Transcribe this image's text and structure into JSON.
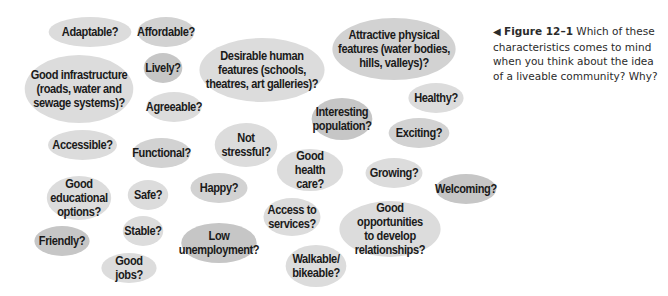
{
  "caption": {
    "arrow": "◀",
    "figure_label": "Figure 12–1",
    "text": "Which of these characteristics comes to mind when you think about the idea of a liveable community? Why?"
  },
  "bubbles": [
    {
      "id": "adaptable",
      "label": "Adaptable?",
      "x": 45,
      "y": 17,
      "w": 90,
      "h": 30,
      "shade": "light"
    },
    {
      "id": "affordable",
      "label": "Affordable?",
      "x": 135,
      "y": 17,
      "w": 62,
      "h": 30,
      "shade": "mid"
    },
    {
      "id": "good-infrastructure",
      "label": "Good infrastructure\n(roads, water and\nsewage systems)?",
      "x": 20,
      "y": 55,
      "w": 118,
      "h": 68,
      "shade": "light"
    },
    {
      "id": "lively",
      "label": "Lively?",
      "x": 142,
      "y": 53,
      "w": 42,
      "h": 30,
      "shade": "dark"
    },
    {
      "id": "agreeable",
      "label": "Agreeable?",
      "x": 144,
      "y": 92,
      "w": 60,
      "h": 30,
      "shade": "light"
    },
    {
      "id": "desirable-human-features",
      "label": "Desirable human\nfeatures (schools,\ntheatres, art galleries)?",
      "x": 194,
      "y": 38,
      "w": 136,
      "h": 64,
      "shade": "light"
    },
    {
      "id": "attractive-physical-features",
      "label": "Attractive physical\nfeatures (water bodies,\nhills, valleys)?",
      "x": 327,
      "y": 18,
      "w": 134,
      "h": 62,
      "shade": "mid"
    },
    {
      "id": "healthy",
      "label": "Healthy?",
      "x": 406,
      "y": 83,
      "w": 60,
      "h": 30,
      "shade": "light"
    },
    {
      "id": "interesting-population",
      "label": "Interesting\npopulation?",
      "x": 309,
      "y": 98,
      "w": 66,
      "h": 42,
      "shade": "dark"
    },
    {
      "id": "exciting",
      "label": "Exciting?",
      "x": 386,
      "y": 118,
      "w": 66,
      "h": 30,
      "shade": "mid"
    },
    {
      "id": "accessible",
      "label": "Accessible?",
      "x": 45,
      "y": 130,
      "w": 75,
      "h": 30,
      "shade": "light"
    },
    {
      "id": "functional",
      "label": "Functional?",
      "x": 130,
      "y": 138,
      "w": 63,
      "h": 30,
      "shade": "mid"
    },
    {
      "id": "not-stressful",
      "label": "Not\nstressful?",
      "x": 212,
      "y": 123,
      "w": 68,
      "h": 44,
      "shade": "light"
    },
    {
      "id": "good-health-care",
      "label": "Good\nhealth care?",
      "x": 274,
      "y": 149,
      "w": 72,
      "h": 42,
      "shade": "light"
    },
    {
      "id": "growing",
      "label": "Growing?",
      "x": 363,
      "y": 158,
      "w": 62,
      "h": 30,
      "shade": "light"
    },
    {
      "id": "welcoming",
      "label": "Welcoming?",
      "x": 433,
      "y": 174,
      "w": 66,
      "h": 30,
      "shade": "dark"
    },
    {
      "id": "good-educational-options",
      "label": "Good\neducational\noptions?",
      "x": 44,
      "y": 176,
      "w": 70,
      "h": 44,
      "shade": "light"
    },
    {
      "id": "safe",
      "label": "Safe?",
      "x": 126,
      "y": 180,
      "w": 44,
      "h": 30,
      "shade": "light"
    },
    {
      "id": "happy",
      "label": "Happy?",
      "x": 188,
      "y": 173,
      "w": 62,
      "h": 30,
      "shade": "mid"
    },
    {
      "id": "access-to-services",
      "label": "Access to\nservices?",
      "x": 261,
      "y": 198,
      "w": 62,
      "h": 38,
      "shade": "light"
    },
    {
      "id": "good-opportunities",
      "label": "Good opportunities\nto develop\nrelationships?",
      "x": 335,
      "y": 201,
      "w": 110,
      "h": 56,
      "shade": "light"
    },
    {
      "id": "friendly",
      "label": "Friendly?",
      "x": 32,
      "y": 226,
      "w": 60,
      "h": 30,
      "shade": "dark"
    },
    {
      "id": "stable",
      "label": "Stable?",
      "x": 121,
      "y": 216,
      "w": 44,
      "h": 30,
      "shade": "light"
    },
    {
      "id": "low-unemployment",
      "label": "Low\nunemployment?",
      "x": 178,
      "y": 223,
      "w": 82,
      "h": 40,
      "shade": "dark"
    },
    {
      "id": "walkable-bikeable",
      "label": "Walkable/\nbikeable?",
      "x": 283,
      "y": 245,
      "w": 66,
      "h": 42,
      "shade": "light"
    },
    {
      "id": "good-jobs",
      "label": "Good jobs?",
      "x": 99,
      "y": 253,
      "w": 60,
      "h": 30,
      "shade": "light"
    }
  ]
}
